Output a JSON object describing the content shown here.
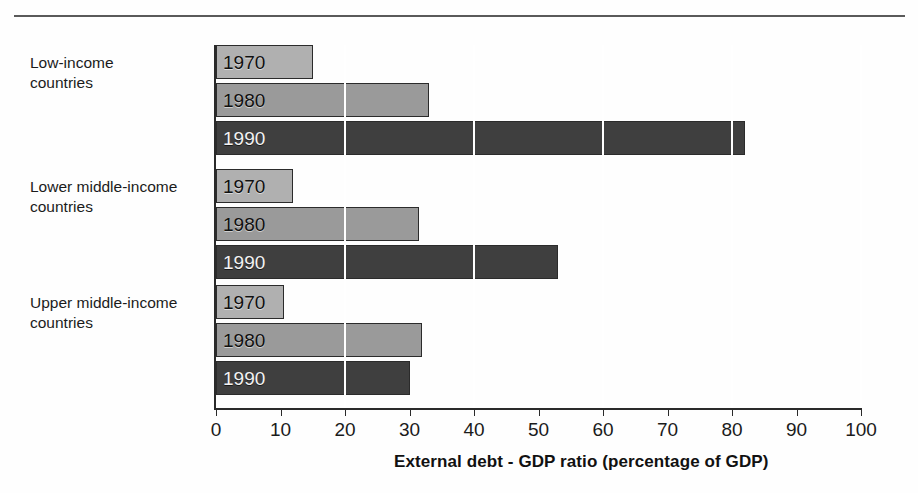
{
  "figure": {
    "title_partial": "",
    "rule": "horizontal-rule"
  },
  "axis": {
    "x_title": "External debt - GDP ratio (percentage of GDP)",
    "tick_labels": [
      "0",
      "10",
      "20",
      "30",
      "40",
      "50",
      "60",
      "70",
      "80",
      "90",
      "100"
    ]
  },
  "groups": [
    {
      "label": "Low-income\ncountries",
      "bars": [
        {
          "year": "1970",
          "value": 15
        },
        {
          "year": "1980",
          "value": 33
        },
        {
          "year": "1990",
          "value": 82
        }
      ]
    },
    {
      "label": "Lower middle-income\ncountries",
      "bars": [
        {
          "year": "1970",
          "value": 12
        },
        {
          "year": "1980",
          "value": 31.5
        },
        {
          "year": "1990",
          "value": 53
        }
      ]
    },
    {
      "label": "Upper middle-income\ncountries",
      "bars": [
        {
          "year": "1970",
          "value": 10.5
        },
        {
          "year": "1980",
          "value": 32
        },
        {
          "year": "1990",
          "value": 30
        }
      ]
    }
  ],
  "colors": {
    "bar_1970": "#b0b0b0",
    "bar_1980": "#9a9a9a",
    "bar_1990": "#3f3f3f",
    "axis": "#2a2a2a",
    "gridline": "#ffffff",
    "text": "#1b1b1b"
  },
  "chart_data": {
    "type": "bar",
    "orientation": "horizontal",
    "title": "",
    "xlabel": "External debt - GDP ratio (percentage of GDP)",
    "ylabel": "",
    "xlim": [
      0,
      100
    ],
    "xticks": [
      0,
      10,
      20,
      30,
      40,
      50,
      60,
      70,
      80,
      90,
      100
    ],
    "grid": "vertical white gridlines every 20 units",
    "legend": "in-bar labels (year printed inside each bar)",
    "categories": [
      "Low-income countries",
      "Lower middle-income countries",
      "Upper middle-income countries"
    ],
    "series": [
      {
        "name": "1970",
        "values": [
          15,
          12,
          10.5
        ]
      },
      {
        "name": "1980",
        "values": [
          33,
          31.5,
          32
        ]
      },
      {
        "name": "1990",
        "values": [
          82,
          53,
          30
        ]
      }
    ]
  }
}
